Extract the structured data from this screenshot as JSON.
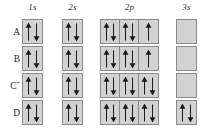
{
  "diagram": {
    "type": "orbital-box-diagram",
    "colors": {
      "background": "#ffffff",
      "cell_fill": "#d2d2d2",
      "cell_border": "#8a8a8a",
      "arrow": "#1a1a1a",
      "text": "#2b2b2b"
    },
    "columns": [
      {
        "label": "1s",
        "orbitals": 1
      },
      {
        "label": "2s",
        "orbitals": 1
      },
      {
        "label": "2p",
        "orbitals": 3
      },
      {
        "label": "3s",
        "orbitals": 1
      }
    ],
    "rows": [
      {
        "label": "A",
        "superscript": "",
        "cells": {
          "1s": [
            [
              "up",
              "down"
            ]
          ],
          "2s": [
            [
              "up",
              "down"
            ]
          ],
          "2p": [
            [
              "up",
              "down"
            ],
            [
              "up",
              "down"
            ],
            [
              "up"
            ]
          ],
          "3s": [
            []
          ]
        }
      },
      {
        "label": "B",
        "superscript": "",
        "cells": {
          "1s": [
            [
              "up",
              "down"
            ]
          ],
          "2s": [
            [
              "up",
              "down"
            ]
          ],
          "2p": [
            [
              "up",
              "down"
            ],
            [
              "up",
              "down"
            ],
            [
              "up"
            ]
          ],
          "3s": [
            []
          ]
        }
      },
      {
        "label": "C",
        "superscript": "+",
        "cells": {
          "1s": [
            [
              "up",
              "down"
            ]
          ],
          "2s": [
            [
              "up",
              "down"
            ]
          ],
          "2p": [
            [
              "up",
              "down"
            ],
            [
              "up",
              "down"
            ],
            [
              "up",
              "down"
            ]
          ],
          "3s": [
            []
          ]
        }
      },
      {
        "label": "D",
        "superscript": "",
        "cells": {
          "1s": [
            [
              "up",
              "down"
            ]
          ],
          "2s": [
            [
              "up",
              "down"
            ]
          ],
          "2p": [
            [
              "up",
              "down"
            ],
            [
              "up",
              "down"
            ],
            [
              "up",
              "down"
            ]
          ],
          "3s": [
            [
              "up",
              "down"
            ]
          ]
        }
      }
    ]
  },
  "layout": {
    "column_x": [
      22,
      62,
      100,
      176
    ],
    "column_width": [
      21,
      21,
      59,
      21
    ],
    "header_x": [
      22,
      62,
      100,
      176
    ],
    "header_width": [
      21,
      21,
      59,
      21
    ],
    "row_y": [
      19,
      46,
      73,
      100
    ],
    "row_height": 25,
    "row_label_y": [
      27,
      54,
      81,
      108
    ]
  }
}
